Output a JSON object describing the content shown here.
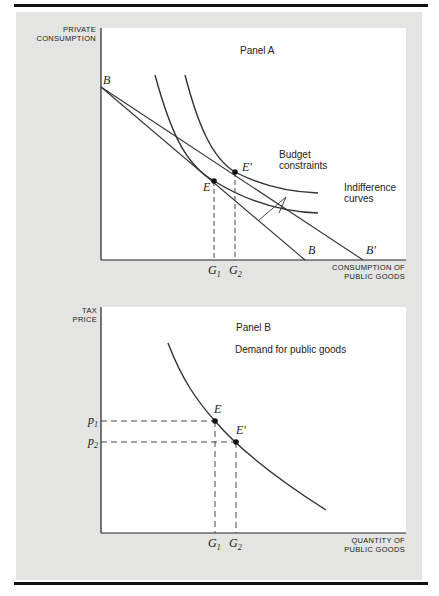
{
  "panel_a": {
    "title": "Panel A",
    "y_axis_label_line1": "PRIVATE",
    "y_axis_label_line2": "CONSUMPTION",
    "x_axis_label_line1": "CONSUMPTION OF",
    "x_axis_label_line2": "PUBLIC GOODS",
    "budget_label_line1": "Budget",
    "budget_label_line2": "constraints",
    "indiff_label_line1": "Indifference",
    "indiff_label_line2": "curves",
    "point_b_top": "B",
    "point_b_axis": "B",
    "point_b_prime": "B′",
    "point_e": "E",
    "point_e_prime": "E′",
    "g1": "G",
    "g1_sub": "1",
    "g2": "G",
    "g2_sub": "2"
  },
  "panel_b": {
    "title": "Panel B",
    "subtitle": "Demand for public goods",
    "y_axis_label_line1": "TAX",
    "y_axis_label_line2": "PRICE",
    "x_axis_label_line1": "QUANTITY OF",
    "x_axis_label_line2": "PUBLIC GOODS",
    "p1": "p",
    "p1_sub": "1",
    "p2": "p",
    "p2_sub": "2",
    "point_e": "E",
    "point_e_prime": "E′",
    "g1": "G",
    "g1_sub": "1",
    "g2": "G",
    "g2_sub": "2"
  }
}
